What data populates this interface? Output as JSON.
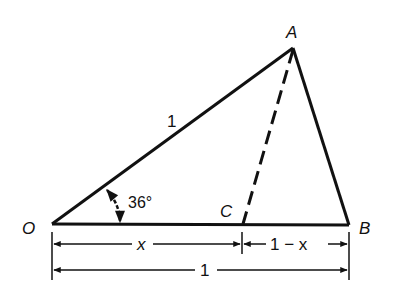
{
  "diagram": {
    "colors": {
      "stroke": "#111111",
      "background": "#ffffff"
    },
    "vertices": {
      "O": {
        "label": "O"
      },
      "A": {
        "label": "A"
      },
      "B": {
        "label": "B"
      },
      "C": {
        "label": "C"
      }
    },
    "labels": {
      "side_OA": "1",
      "angle": "36°",
      "seg_OC": "x",
      "seg_CB": "1 − x",
      "seg_OB": "1"
    },
    "edges": [
      {
        "from": "O",
        "to": "A",
        "style": "solid"
      },
      {
        "from": "A",
        "to": "B",
        "style": "solid"
      },
      {
        "from": "O",
        "to": "B",
        "style": "solid"
      },
      {
        "from": "A",
        "to": "C",
        "style": "dashed"
      }
    ]
  }
}
